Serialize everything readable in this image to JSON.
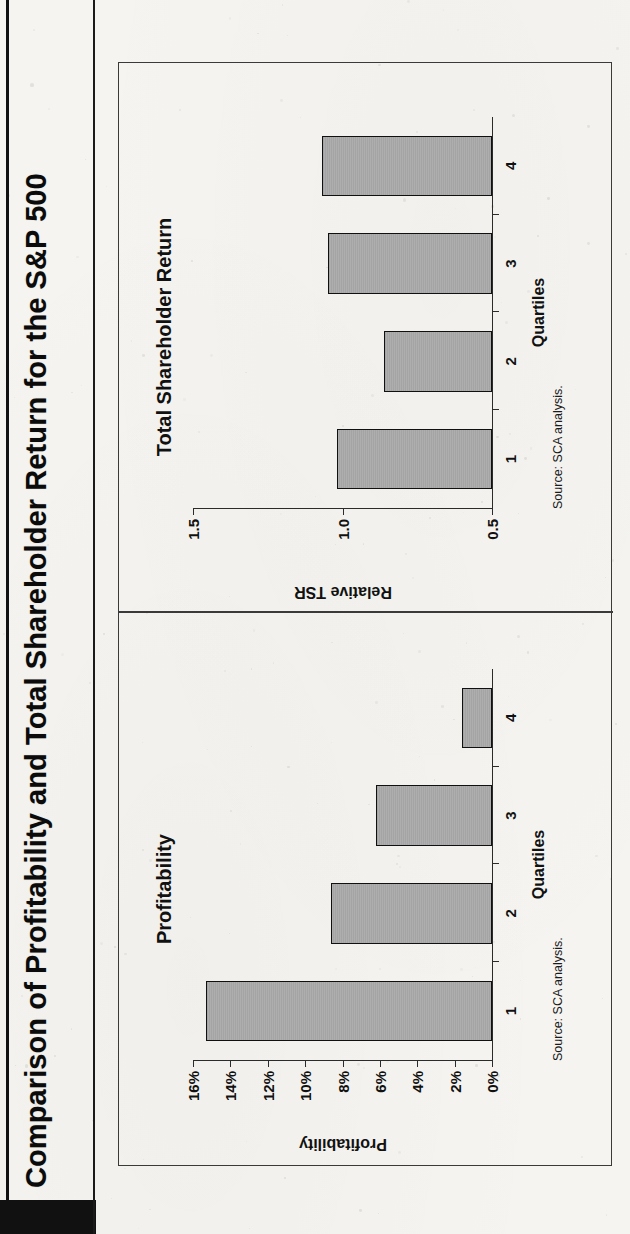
{
  "document": {
    "title": "Comparison of Profitability and Total Shareholder Return for the S&P 500"
  },
  "panels": {
    "left": {
      "title": "Profitability",
      "source": "Source: SCA analysis.",
      "xlabel": "Quartiles",
      "ylabel": "Profitability"
    },
    "right": {
      "title": "Total Shareholder Return",
      "source": "Source: SCA analysis.",
      "xlabel": "Quartiles",
      "ylabel": "Relative TSR"
    }
  },
  "chart_data": [
    {
      "type": "bar",
      "title": "Profitability",
      "xlabel": "Quartiles",
      "ylabel": "Profitability",
      "categories": [
        "1",
        "2",
        "3",
        "4"
      ],
      "values": [
        15.3,
        8.6,
        6.2,
        1.6
      ],
      "value_unit": "percent",
      "ylim": [
        0,
        16
      ],
      "yticks": [
        0,
        2,
        4,
        6,
        8,
        10,
        12,
        14,
        16
      ],
      "ytick_labels": [
        "0%",
        "2%",
        "4%",
        "6%",
        "8%",
        "10%",
        "12%",
        "14%",
        "16%"
      ],
      "grid": false,
      "legend": "none",
      "bar_color": "#a9a9a9",
      "bar_edge_color": "#101010",
      "annotation": "Source: SCA analysis."
    },
    {
      "type": "bar",
      "title": "Total Shareholder Return",
      "xlabel": "Quartiles",
      "ylabel": "Relative TSR",
      "categories": [
        "1",
        "2",
        "3",
        "4"
      ],
      "values": [
        1.02,
        0.86,
        1.05,
        1.07
      ],
      "value_unit": "ratio",
      "ylim": [
        0.5,
        1.5
      ],
      "yticks": [
        0.5,
        1.0,
        1.5
      ],
      "ytick_labels": [
        "0.5",
        "1.0",
        "1.5"
      ],
      "grid": false,
      "legend": "none",
      "bar_color": "#a9a9a9",
      "bar_edge_color": "#101010",
      "annotation": "Source: SCA analysis."
    }
  ],
  "colors": {
    "paper": "#f5f4f0",
    "ink": "#111111",
    "bar_fill": "#a9a9a9",
    "bar_stroke": "#101010",
    "axis": "#2b2b2b"
  }
}
